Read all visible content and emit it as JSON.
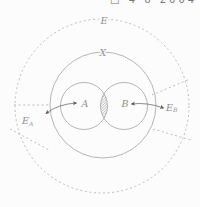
{
  "page": {
    "background": "#fcfcfc",
    "top_clipped_text": "□ 4 6 2004"
  },
  "diagram": {
    "labels": {
      "universe": "E",
      "sample_space": "X",
      "set_a": "A",
      "set_b": "B",
      "ext_a_base": "E",
      "ext_a_sub": "A",
      "ext_b_base": "E",
      "ext_b_sub": "B"
    },
    "colors": {
      "outline": "#a3a3a3",
      "dashed": "#b5b5b5",
      "label": "#8f8f8f",
      "arrow": "#5a5a5a",
      "hatch": "#9e9e9e",
      "bg": "#fcfcfc"
    }
  }
}
